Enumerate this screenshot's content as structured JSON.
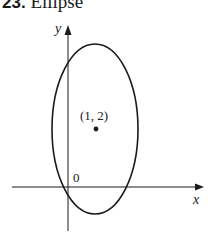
{
  "title": {
    "number": "23.",
    "text": "Ellipse"
  },
  "axes": {
    "x_label": "x",
    "y_label": "y",
    "origin_label": "0"
  },
  "point": {
    "label": "(1, 2)",
    "x": 1,
    "y": 2
  },
  "ellipse": {
    "center": [
      1,
      2
    ],
    "stroke_color": "#1a1a1a"
  }
}
